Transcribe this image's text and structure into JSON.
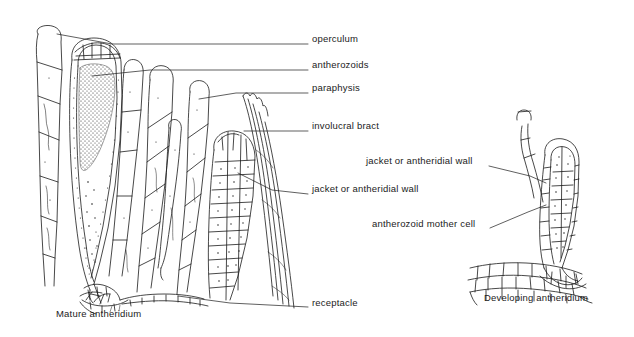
{
  "figure": {
    "background": "#ffffff",
    "ink": "#1b1b1b",
    "type": "botanical-line-diagram"
  },
  "labels": [
    {
      "id": "operculum",
      "text": "operculum",
      "x": 312,
      "y": 39,
      "leader": {
        "x1": 308,
        "y1": 44,
        "x2": 112,
        "y2": 44,
        "x3": 57,
        "y3": 34
      }
    },
    {
      "id": "antherozoids",
      "text": "antherozoids",
      "x": 312,
      "y": 65,
      "leader": {
        "x1": 308,
        "y1": 70,
        "x2": 150,
        "y2": 70,
        "x3": 92,
        "y3": 76
      }
    },
    {
      "id": "paraphysis",
      "text": "paraphysis",
      "x": 312,
      "y": 88,
      "leader": {
        "x1": 308,
        "y1": 93,
        "x2": 236,
        "y2": 93,
        "x3": 199,
        "y3": 99
      }
    },
    {
      "id": "involucral-bract",
      "text": "involucral bract",
      "x": 312,
      "y": 126,
      "leader": {
        "x1": 308,
        "y1": 131,
        "x2": 262,
        "y2": 131,
        "x3": 244,
        "y3": 131
      }
    },
    {
      "id": "jacket-wall-left",
      "text": "jacket or antheridial wall",
      "x": 312,
      "y": 189,
      "leader": {
        "x1": 308,
        "y1": 194,
        "x2": 272,
        "y2": 190,
        "x3": 238,
        "y3": 173
      }
    },
    {
      "id": "receptacle",
      "text": "receptacle",
      "x": 312,
      "y": 303,
      "leader": {
        "x1": 308,
        "y1": 307,
        "x2": 230,
        "y2": 303,
        "x3": 178,
        "y3": 296
      }
    },
    {
      "id": "jacket-wall-right",
      "text": "jacket or antheridial wall",
      "x": 366,
      "y": 161,
      "leader": {
        "x1": 489,
        "y1": 166,
        "x2": 530,
        "y2": 176,
        "x3": 546,
        "y3": 183
      }
    },
    {
      "id": "antherozoid-mother-cell",
      "text": "antherozoid mother cell",
      "x": 372,
      "y": 224,
      "leader": {
        "x1": 490,
        "y1": 228,
        "x2": 528,
        "y2": 212,
        "x3": 546,
        "y3": 205
      }
    }
  ],
  "captions": [
    {
      "id": "mature-antheridium",
      "text": "Mature antheridium",
      "x": 56,
      "y": 313
    },
    {
      "id": "developing-antheridium",
      "text": "Developing antheridium",
      "x": 484,
      "y": 297
    }
  ],
  "structures": {
    "left_group_title": "Mature antheridium",
    "right_group_title": "Developing antheridium",
    "parts": [
      "operculum",
      "antherozoids",
      "paraphysis",
      "involucral bract",
      "jacket or antheridial wall",
      "antherozoid mother cell",
      "receptacle"
    ]
  }
}
